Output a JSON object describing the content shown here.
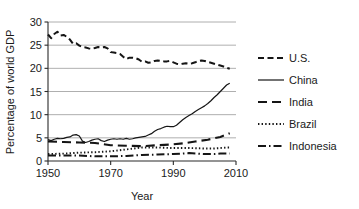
{
  "chart_data": {
    "type": "line",
    "title": "",
    "xlabel": "Year",
    "ylabel": "Percentage of world GDP",
    "xlim": [
      1950,
      2010
    ],
    "ylim": [
      0,
      30
    ],
    "xticks": [
      1950,
      1970,
      1990,
      2010
    ],
    "yticks": [
      0,
      5,
      10,
      15,
      20,
      25,
      30
    ],
    "grid": "horizontal",
    "legend_position": "right",
    "series": [
      {
        "name": "U.S.",
        "style": "dashed",
        "color": "#151515",
        "x": [
          1950,
          1951,
          1952,
          1953,
          1954,
          1955,
          1956,
          1957,
          1958,
          1959,
          1960,
          1961,
          1962,
          1963,
          1964,
          1965,
          1966,
          1967,
          1968,
          1969,
          1970,
          1971,
          1972,
          1973,
          1974,
          1975,
          1976,
          1977,
          1978,
          1979,
          1980,
          1981,
          1982,
          1983,
          1984,
          1985,
          1986,
          1987,
          1988,
          1989,
          1990,
          1991,
          1992,
          1993,
          1994,
          1995,
          1996,
          1997,
          1998,
          1999,
          2000,
          2001,
          2002,
          2003,
          2004,
          2005,
          2006,
          2007,
          2008
        ],
        "values": [
          27.3,
          26.5,
          27.4,
          27.9,
          27.1,
          27.2,
          26.8,
          26.2,
          25.3,
          25.4,
          24.9,
          24.6,
          24.5,
          24.3,
          24.2,
          24.4,
          24.6,
          24.5,
          24.6,
          24.3,
          23.5,
          23.4,
          23.3,
          23.1,
          22.5,
          22.0,
          22.3,
          22.3,
          22.2,
          21.9,
          21.4,
          21.5,
          21.2,
          21.3,
          21.6,
          21.7,
          21.6,
          21.5,
          21.5,
          21.6,
          21.3,
          21.0,
          20.9,
          21.0,
          21.1,
          21.0,
          21.1,
          21.3,
          21.6,
          21.7,
          21.6,
          21.4,
          21.2,
          21.0,
          20.8,
          20.6,
          20.4,
          20.1,
          19.9
        ]
      },
      {
        "name": "China",
        "style": "solid",
        "color": "#6e6e6e",
        "x": [
          1950,
          1951,
          1952,
          1953,
          1954,
          1955,
          1956,
          1957,
          1958,
          1959,
          1960,
          1961,
          1962,
          1963,
          1964,
          1965,
          1966,
          1967,
          1968,
          1969,
          1970,
          1971,
          1972,
          1973,
          1974,
          1975,
          1976,
          1977,
          1978,
          1979,
          1980,
          1981,
          1982,
          1983,
          1984,
          1985,
          1986,
          1987,
          1988,
          1989,
          1990,
          1991,
          1992,
          1993,
          1994,
          1995,
          1996,
          1997,
          1998,
          1999,
          2000,
          2001,
          2002,
          2003,
          2004,
          2005,
          2006,
          2007,
          2008
        ],
        "values": [
          4.6,
          4.4,
          4.7,
          4.9,
          4.8,
          4.9,
          5.1,
          5.2,
          5.6,
          5.7,
          5.4,
          4.3,
          4.0,
          4.2,
          4.5,
          4.7,
          4.8,
          4.4,
          4.2,
          4.5,
          4.7,
          4.8,
          4.7,
          4.8,
          4.7,
          4.9,
          4.7,
          4.8,
          5.0,
          5.1,
          5.2,
          5.3,
          5.6,
          5.9,
          6.4,
          6.8,
          7.0,
          7.3,
          7.5,
          7.4,
          7.4,
          7.7,
          8.3,
          8.9,
          9.4,
          9.8,
          10.2,
          10.7,
          11.1,
          11.5,
          11.9,
          12.4,
          13.0,
          13.7,
          14.3,
          15.0,
          15.7,
          16.4,
          16.8
        ]
      },
      {
        "name": "India",
        "style": "longdash",
        "color": "#151515",
        "x": [
          1950,
          1955,
          1960,
          1965,
          1970,
          1975,
          1980,
          1985,
          1990,
          1993,
          1995,
          1997,
          1999,
          2001,
          2003,
          2005,
          2007,
          2008
        ],
        "values": [
          4.2,
          4.1,
          4.0,
          3.9,
          3.4,
          3.3,
          3.2,
          3.4,
          3.6,
          3.8,
          4.0,
          4.2,
          4.4,
          4.6,
          4.9,
          5.2,
          5.7,
          6.0
        ]
      },
      {
        "name": "Brazil",
        "style": "dotted",
        "color": "#151515",
        "x": [
          1950,
          1955,
          1960,
          1965,
          1970,
          1975,
          1980,
          1985,
          1990,
          1995,
          2000,
          2003,
          2005,
          2007,
          2008
        ],
        "values": [
          1.5,
          1.6,
          1.8,
          1.9,
          2.1,
          2.5,
          2.9,
          2.9,
          2.8,
          2.8,
          2.7,
          2.7,
          2.8,
          2.9,
          2.9
        ]
      },
      {
        "name": "Indonesia",
        "style": "dashdot",
        "color": "#151515",
        "x": [
          1950,
          1955,
          1960,
          1965,
          1970,
          1975,
          1980,
          1985,
          1990,
          1995,
          2000,
          2003,
          2005,
          2007,
          2008
        ],
        "values": [
          1.2,
          1.2,
          1.2,
          1.0,
          1.0,
          1.1,
          1.3,
          1.4,
          1.5,
          1.7,
          1.5,
          1.5,
          1.6,
          1.6,
          1.6
        ]
      }
    ]
  },
  "axes": {
    "ylabel": "Percentage of world GDP",
    "xlabel": "Year",
    "ytick_labels": [
      "0",
      "5",
      "10",
      "15",
      "20",
      "25",
      "30"
    ],
    "xtick_labels": [
      "1950",
      "1970",
      "1990",
      "2010"
    ]
  },
  "legend": {
    "entries": [
      {
        "label": "U.S.",
        "style": "dashed"
      },
      {
        "label": "China",
        "style": "solid"
      },
      {
        "label": "India",
        "style": "longdash"
      },
      {
        "label": "Brazil",
        "style": "dotted"
      },
      {
        "label": "Indonesia",
        "style": "dashdot"
      }
    ]
  },
  "colors": {
    "line_dark": "#151515",
    "line_gray": "#6e6e6e",
    "grid": "#9a9a9a",
    "axis": "#2a2a2a",
    "background": "#ffffff"
  }
}
